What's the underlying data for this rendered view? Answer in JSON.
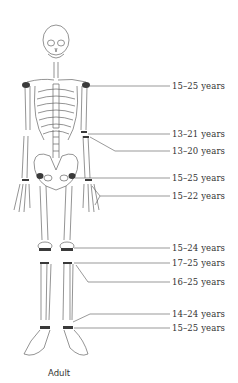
{
  "diagram": {
    "type": "anatomical skeleton - epiphyseal fusion ages",
    "caption": "Adult",
    "line_color": "#555555",
    "ossification_color": "#3a3a3a",
    "labels": [
      {
        "id": "shoulder",
        "text": "15–25 years",
        "y": 85
      },
      {
        "id": "elbow-humerus",
        "text": "13–21 years",
        "y": 134
      },
      {
        "id": "elbow-radius",
        "text": "13–20 years",
        "y": 151
      },
      {
        "id": "hip",
        "text": "15–25 years",
        "y": 178
      },
      {
        "id": "wrist",
        "text": "15–22 years",
        "y": 196
      },
      {
        "id": "knee-femur",
        "text": "15–24 years",
        "y": 246
      },
      {
        "id": "knee-tibia",
        "text": "17–25 years",
        "y": 262
      },
      {
        "id": "knee-fibula",
        "text": "16–25 years",
        "y": 281
      },
      {
        "id": "ankle-tibia",
        "text": "14–24 years",
        "y": 313
      },
      {
        "id": "ankle-fibula",
        "text": "15–25 years",
        "y": 328
      }
    ]
  }
}
